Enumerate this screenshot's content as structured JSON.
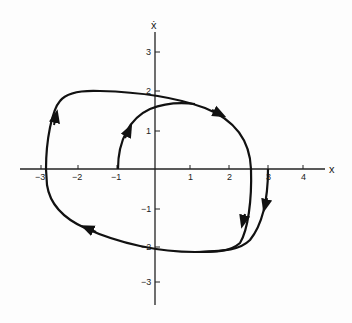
{
  "diagram": {
    "type": "phase-portrait",
    "axes": {
      "x_label": "x",
      "y_label": "ẋ",
      "x_ticks": [
        {
          "value": -3,
          "label": "−3"
        },
        {
          "value": -2,
          "label": "−2"
        },
        {
          "value": -1,
          "label": "−1"
        },
        {
          "value": 1,
          "label": "1"
        },
        {
          "value": 2,
          "label": "2"
        },
        {
          "value": 3,
          "label": "3"
        },
        {
          "value": 4,
          "label": "4"
        }
      ],
      "y_ticks": [
        {
          "value": 3,
          "label": "3"
        },
        {
          "value": 2,
          "label": "2"
        },
        {
          "value": 1,
          "label": "1"
        },
        {
          "value": -1,
          "label": "−1"
        },
        {
          "value": -2,
          "label": "−2"
        },
        {
          "value": -3,
          "label": "−3"
        }
      ]
    },
    "trajectories": [
      {
        "name": "trajectory-from-minus-1",
        "start": [
          -1,
          0
        ],
        "description": "rises to merge with limit cycle near (1, 1.7)"
      },
      {
        "name": "trajectory-from-3",
        "start": [
          3,
          0
        ],
        "description": "descends to merge with limit cycle near (1.2, -2)"
      },
      {
        "name": "limit-cycle",
        "description": "closed orbit crossing x-axis near -2.9 and 2.55, ẋ-axis near 1.8 and -1.9"
      }
    ],
    "stroke_color": "#111111"
  }
}
